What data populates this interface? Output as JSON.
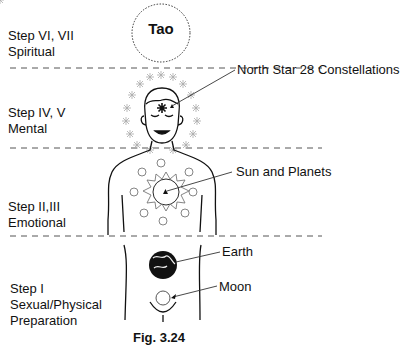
{
  "figure": {
    "caption": "Fig. 3.24",
    "top_circle_label": "Tao",
    "steps": [
      {
        "line1": "Step VI, VII",
        "line2": "Spiritual"
      },
      {
        "line1": "Step IV, V",
        "line2": "Mental"
      },
      {
        "line1": "Step II,III",
        "line2": "Emotional"
      },
      {
        "line1": "Step I",
        "line2": "Sexual/Physical",
        "line3": "Preparation"
      }
    ],
    "callouts": {
      "north_star": "North Star 28 Constellations",
      "sun": "Sun and Planets",
      "earth": "Earth",
      "moon": "Moon"
    }
  }
}
